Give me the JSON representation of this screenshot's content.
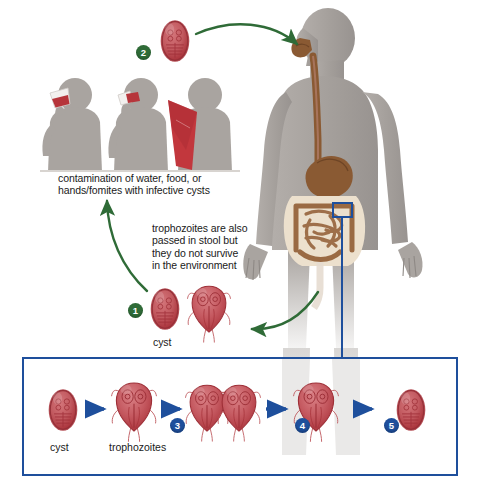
{
  "diagram": {
    "colors": {
      "green_arrow": "#2f6b37",
      "blue_line": "#1e4f9c",
      "parasite_red": "#b9353c",
      "parasite_fill": "#c9565c",
      "silhouette_gray": "#a9a4a0",
      "gut_brown": "#8a5a33",
      "intestine_tan": "#ece0cd",
      "background": "#ffffff"
    },
    "annotations": [
      {
        "name": "contamination-caption",
        "text": "contamination of water, food, or\nhands/fomites with infective cysts",
        "x": 58,
        "y": 172
      },
      {
        "name": "trophozoite-caption",
        "text": "trophozoites are also\npassed in stool but\nthey do not survive\nin the environment",
        "x": 152,
        "y": 222
      }
    ],
    "stage_markers": [
      {
        "name": "marker-1",
        "label": "1",
        "color": "green",
        "x": 128,
        "y": 303
      },
      {
        "name": "marker-2",
        "label": "2",
        "color": "green",
        "x": 136,
        "y": 45
      },
      {
        "name": "marker-3",
        "label": "3",
        "color": "blue",
        "x": 170,
        "y": 418
      },
      {
        "name": "marker-4",
        "label": "4",
        "color": "blue",
        "x": 295,
        "y": 418
      },
      {
        "name": "marker-5",
        "label": "5",
        "color": "blue",
        "x": 384,
        "y": 418
      }
    ],
    "cycle_labels": [
      {
        "name": "cyst-label-upper",
        "text": "cyst",
        "x": 153,
        "y": 339
      }
    ],
    "panel": {
      "name": "intracellular-panel",
      "x": 22,
      "y": 357,
      "width": 437,
      "height": 120,
      "labels": [
        {
          "name": "panel-cyst-label",
          "text": "cyst",
          "x": 53,
          "y": 448
        },
        {
          "name": "panel-trophozoites-label",
          "text": "trophozoites",
          "x": 112,
          "y": 448
        }
      ],
      "sequence": [
        {
          "name": "panel-cyst",
          "type": "cyst"
        },
        {
          "name": "panel-trophozoite",
          "type": "trophozoite"
        },
        {
          "name": "panel-dividing-trophozoites",
          "type": "trophozoite-pair"
        },
        {
          "name": "panel-trophozoite-encysting",
          "type": "trophozoite"
        },
        {
          "name": "panel-cyst-formed",
          "type": "cyst"
        }
      ]
    },
    "figures": [
      {
        "name": "person-drinking-water",
        "action": "drinking from glass"
      },
      {
        "name": "person-eating-food",
        "action": "eating contaminated food"
      },
      {
        "name": "contaminated-towel",
        "action": "fomite towel"
      },
      {
        "name": "human-body-figure",
        "action": "host with digestive tract"
      }
    ],
    "organisms": [
      {
        "name": "infective-cyst-ingested",
        "type": "cyst"
      },
      {
        "name": "excreted-cyst",
        "type": "cyst"
      },
      {
        "name": "excreted-trophozoite",
        "type": "trophozoite"
      }
    ]
  }
}
